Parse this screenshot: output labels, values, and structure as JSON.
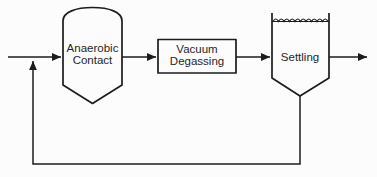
{
  "diagram": {
    "type": "process-flow-diagram",
    "background_color": "#fcfcfc",
    "line_color": "#1c1c1c",
    "text_color": "#262626",
    "nodes": {
      "anaerobic_contact": {
        "shape": "domed-vessel",
        "line1": "Anaerobic",
        "line2": "Contact"
      },
      "vacuum_degassing": {
        "shape": "rectangle",
        "line1": "Vacuum",
        "line2": "Degassing"
      },
      "settling": {
        "shape": "settling-tank",
        "line1": "Settling"
      }
    },
    "flows": [
      {
        "name": "influent",
        "from": "left-edge",
        "to": "anaerobic_contact"
      },
      {
        "name": "vessel-to-degasser",
        "from": "anaerobic_contact",
        "to": "vacuum_degassing"
      },
      {
        "name": "degasser-to-settler",
        "from": "vacuum_degassing",
        "to": "settling"
      },
      {
        "name": "effluent",
        "from": "settling",
        "to": "right-edge"
      },
      {
        "name": "sludge-recycle",
        "from": "settling-underflow",
        "to": "influent-junction"
      }
    ]
  }
}
